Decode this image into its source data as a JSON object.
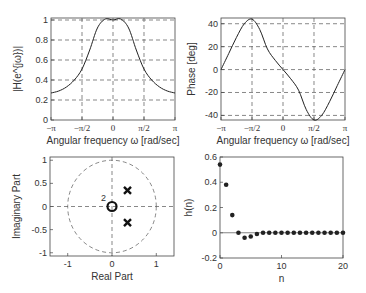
{
  "chart_data": [
    {
      "type": "line",
      "title": "",
      "xlabel": "Angular frequency ω [rad/sec]",
      "ylabel": "|H(e^{jω})|",
      "xticks": [
        "−π",
        "−π/2",
        "0",
        "π/2",
        "π"
      ],
      "yticks": [
        "0",
        "0.2",
        "0.4",
        "0.6",
        "0.8",
        "1"
      ],
      "xlim": [
        -3.1416,
        3.1416
      ],
      "ylim": [
        0,
        1.02
      ],
      "grid": true,
      "x": [
        -3.1416,
        -2.75,
        -2.36,
        -1.96,
        -1.57,
        -1.18,
        -0.79,
        -0.39,
        0,
        0.39,
        0.79,
        1.18,
        1.57,
        1.96,
        2.36,
        2.75,
        3.1416
      ],
      "values": [
        0.27,
        0.29,
        0.33,
        0.4,
        0.51,
        0.7,
        0.92,
        1.01,
        1.0,
        1.01,
        0.92,
        0.7,
        0.51,
        0.4,
        0.33,
        0.29,
        0.27
      ]
    },
    {
      "type": "line",
      "title": "",
      "xlabel": "Angular frequency ω [rad/sec]",
      "ylabel": "Phase [deg]",
      "xticks": [
        "−π",
        "−π/2",
        "0",
        "π/2",
        "π"
      ],
      "yticks": [
        "-40",
        "-20",
        "0",
        "20",
        "40"
      ],
      "xlim": [
        -3.1416,
        3.1416
      ],
      "ylim": [
        -44,
        45
      ],
      "grid": true,
      "x": [
        -3.1416,
        -2.75,
        -2.36,
        -1.96,
        -1.57,
        -1.18,
        -0.79,
        -0.39,
        0,
        0.39,
        0.79,
        1.18,
        1.57,
        1.96,
        2.36,
        2.75,
        3.1416
      ],
      "values": [
        0,
        14,
        28,
        40,
        44,
        35,
        18,
        8,
        0,
        -8,
        -18,
        -35,
        -44,
        -40,
        -28,
        -14,
        0
      ]
    },
    {
      "type": "scatter",
      "title": "",
      "xlabel": "Real Part",
      "ylabel": "Imaginary Part",
      "xticks": [
        "-1",
        "0",
        "1"
      ],
      "yticks": [
        "-1",
        "-0.5",
        "0",
        "0.5",
        "1"
      ],
      "xlim": [
        -1.4,
        1.4
      ],
      "ylim": [
        -1.07,
        1.07
      ],
      "unit_circle": true,
      "zeros": [
        {
          "re": 0,
          "im": 0,
          "multiplicity": 2
        }
      ],
      "poles": [
        {
          "re": 0.35,
          "im": 0.35
        },
        {
          "re": 0.35,
          "im": -0.35
        }
      ],
      "annotations": [
        "2"
      ]
    },
    {
      "type": "scatter",
      "title": "",
      "xlabel": "n",
      "ylabel": "h(n)",
      "xticks": [
        "0",
        "10",
        "20"
      ],
      "yticks": [
        "-0.2",
        "0",
        "0.2",
        "0.4",
        "0.6"
      ],
      "xlim": [
        0,
        20
      ],
      "ylim": [
        -0.2,
        0.6
      ],
      "grid": false,
      "x": [
        0,
        1,
        2,
        3,
        4,
        5,
        6,
        7,
        8,
        9,
        10,
        11,
        12,
        13,
        14,
        15,
        16,
        17,
        18,
        19,
        20
      ],
      "values": [
        0.54,
        0.38,
        0.14,
        0.0,
        -0.04,
        -0.03,
        -0.01,
        0.0,
        0.0,
        0.0,
        0.0,
        0.0,
        0.0,
        0.0,
        0.0,
        0.0,
        0.0,
        0.0,
        0.0,
        0.0,
        0.0
      ]
    }
  ]
}
